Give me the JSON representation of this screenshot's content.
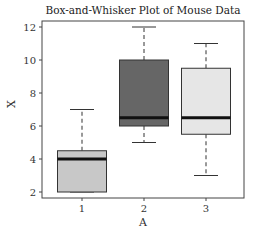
{
  "chart_data": {
    "type": "box",
    "title": "Box-and-Whisker Plot of Mouse Data",
    "xlabel": "A",
    "ylabel": "X",
    "categories": [
      "1",
      "2",
      "3"
    ],
    "ylim": [
      1.7,
      12.5
    ],
    "yticks": [
      2,
      4,
      6,
      8,
      10,
      12
    ],
    "grid": false,
    "boxes": [
      {
        "category": "1",
        "whisker_low": 2,
        "q1": 2,
        "median": 4,
        "q3": 4.5,
        "whisker_high": 7,
        "color": "#c8c8c8"
      },
      {
        "category": "2",
        "whisker_low": 5,
        "q1": 6,
        "median": 6.5,
        "q3": 10,
        "whisker_high": 12,
        "color": "#666666"
      },
      {
        "category": "3",
        "whisker_low": 3,
        "q1": 5.5,
        "median": 6.5,
        "q3": 9.5,
        "whisker_high": 11,
        "color": "#e6e6e6"
      }
    ]
  }
}
